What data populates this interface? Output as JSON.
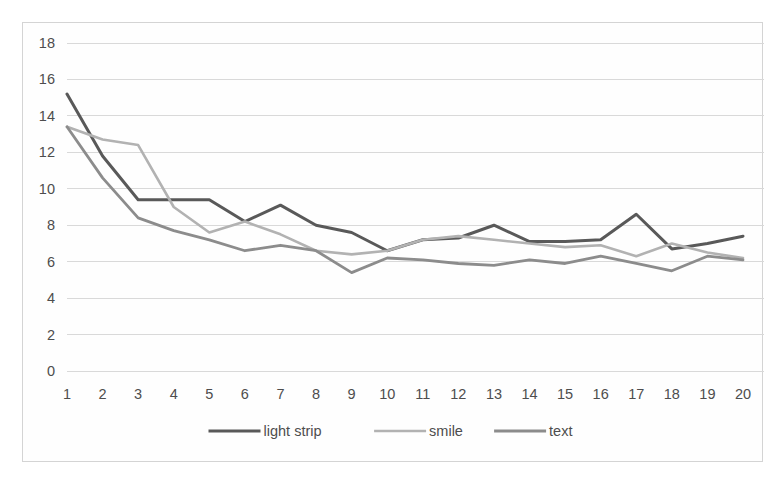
{
  "chart_data": {
    "type": "line",
    "title": "",
    "subtitle": "",
    "xlabel": "",
    "ylabel": "",
    "x": [
      1,
      2,
      3,
      4,
      5,
      6,
      7,
      8,
      9,
      10,
      11,
      12,
      13,
      14,
      15,
      16,
      17,
      18,
      19,
      20
    ],
    "xtick_labels": [
      "1",
      "2",
      "3",
      "4",
      "5",
      "6",
      "7",
      "8",
      "9",
      "10",
      "11",
      "12",
      "13",
      "14",
      "15",
      "16",
      "17",
      "18",
      "19",
      "20"
    ],
    "ytick_labels": [
      "0",
      "2",
      "4",
      "6",
      "8",
      "10",
      "12",
      "14",
      "16",
      "18"
    ],
    "yticks": [
      0,
      2,
      4,
      6,
      8,
      10,
      12,
      14,
      16,
      18
    ],
    "ylim": [
      0,
      18
    ],
    "xlim": [
      1,
      20
    ],
    "grid": "horizontal",
    "legend_position": "bottom",
    "series": [
      {
        "name": "light strip",
        "color": "#595959",
        "linewidth": 3.0,
        "values": [
          15.2,
          11.8,
          9.4,
          9.4,
          9.4,
          8.2,
          9.1,
          8.0,
          7.6,
          6.6,
          7.2,
          7.3,
          8.0,
          7.1,
          7.1,
          7.2,
          8.6,
          6.7,
          7.0,
          7.4
        ]
      },
      {
        "name": "smile",
        "color": "#b2b2b2",
        "linewidth": 2.6,
        "values": [
          13.4,
          12.7,
          12.4,
          9.0,
          7.6,
          8.2,
          7.5,
          6.6,
          6.4,
          6.6,
          7.2,
          7.4,
          7.2,
          7.0,
          6.8,
          6.9,
          6.3,
          7.0,
          6.5,
          6.2
        ]
      },
      {
        "name": "text",
        "color": "#8c8c8c",
        "linewidth": 2.8,
        "values": [
          13.4,
          10.6,
          8.4,
          7.7,
          7.2,
          6.6,
          6.9,
          6.6,
          5.4,
          6.2,
          6.1,
          5.9,
          5.8,
          6.1,
          5.9,
          6.3,
          5.9,
          5.5,
          6.3,
          6.1
        ]
      }
    ]
  },
  "legend": {
    "items": [
      {
        "label": "light strip",
        "color": "#595959"
      },
      {
        "label": "smile",
        "color": "#b2b2b2"
      },
      {
        "label": "text",
        "color": "#8c8c8c"
      }
    ]
  },
  "colors": {
    "grid": "#d9d9d9",
    "border": "#d4d4d4",
    "text": "#4d4d4d",
    "background": "#ffffff"
  }
}
